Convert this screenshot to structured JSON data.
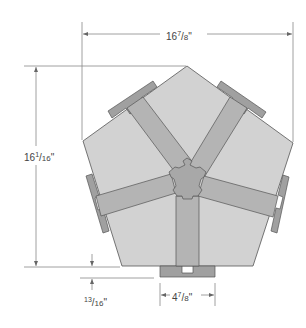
{
  "diagram": {
    "type": "technical-drawing",
    "colors": {
      "panel_fill": "#d2d2d2",
      "spline_fill": "#b4b4b4",
      "hub_fill": "#a8a8a8",
      "cap_fill": "#a0a0a0",
      "outline": "#555555",
      "dimension_line": "#888888",
      "text": "#444444"
    },
    "dimensions": {
      "width": {
        "whole": "16",
        "num": "7",
        "den": "8",
        "unit": "\""
      },
      "height": {
        "whole": "16",
        "num": "1",
        "den": "16",
        "unit": "\""
      },
      "cap_offset": {
        "whole": "",
        "num": "13",
        "den": "16",
        "unit": "\""
      },
      "cap_width": {
        "whole": "4",
        "num": "7",
        "den": "8",
        "unit": "\""
      }
    }
  }
}
